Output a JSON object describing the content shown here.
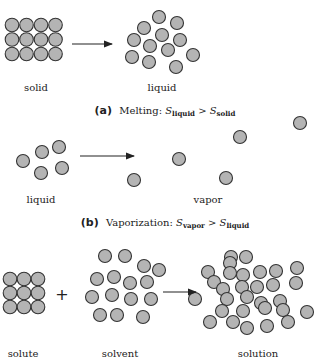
{
  "style": {
    "particle_fill": "#b4b4b4",
    "particle_stroke": "#333333",
    "arrow_color": "#222222"
  },
  "panel_a": {
    "caption": {
      "tag": "(a)",
      "title": "Melting:",
      "lhs_symbol": "S",
      "lhs_sub": "liquid",
      "relation": ">",
      "rhs_symbol": "S",
      "rhs_sub": "solid"
    },
    "left_label": "solid",
    "right_label": "liquid"
  },
  "panel_b": {
    "caption": {
      "tag": "(b)",
      "title": "Vaporization:",
      "lhs_symbol": "S",
      "lhs_sub": "vapor",
      "relation": ">",
      "rhs_symbol": "S",
      "rhs_sub": "liquid"
    },
    "left_label": "liquid",
    "right_label": "vapor"
  },
  "panel_c": {
    "solute_label": "solute",
    "operator": "+",
    "solvent_label": "solvent",
    "solution_label": "solution"
  }
}
